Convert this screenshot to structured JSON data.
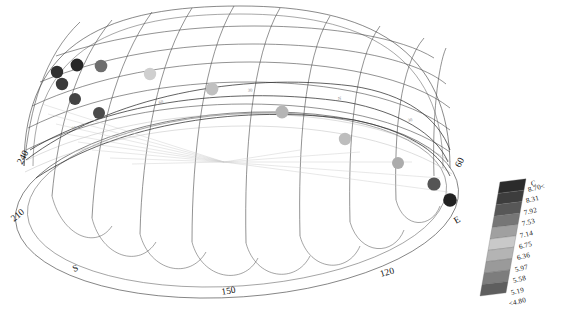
{
  "figure": {
    "kind": "sun-path-sky-dome",
    "caption": "",
    "background_color": "#ffffff",
    "line_color": "#3a3a3a",
    "faint_line_color": "#b9b9b9"
  },
  "azimuth_axis": {
    "name": "azimuth",
    "labels": [
      {
        "text": "240",
        "x": 22,
        "y": 165,
        "rotate": -62
      },
      {
        "text": "210",
        "x": 14,
        "y": 222,
        "rotate": -40
      },
      {
        "text": "S",
        "x": 74,
        "y": 272,
        "rotate": -22
      },
      {
        "text": "150",
        "x": 222,
        "y": 295,
        "rotate": -10
      },
      {
        "text": "120",
        "x": 381,
        "y": 277,
        "rotate": -16
      },
      {
        "text": "E",
        "x": 456,
        "y": 224,
        "rotate": -30
      },
      {
        "text": "60",
        "x": 460,
        "y": 168,
        "rotate": -62
      }
    ]
  },
  "elevation_axis": {
    "name": "elevation",
    "labels": [
      {
        "text": "30",
        "x": 72,
        "y": 130,
        "rotate": -14
      },
      {
        "text": "60",
        "x": 159,
        "y": 104,
        "rotate": -12
      },
      {
        "text": "30",
        "x": 248,
        "y": 92,
        "rotate": -7
      },
      {
        "text": "N",
        "x": 338,
        "y": 100,
        "rotate": -4
      },
      {
        "text": "30",
        "x": 408,
        "y": 122,
        "rotate": -10
      }
    ]
  },
  "colorbar": {
    "name": "temperature-colorbar",
    "unit_label": "C",
    "orientation": "vertical-tilted",
    "tilt_degrees": -13,
    "ticks": [
      {
        "text": "8.70<",
        "value": 8.7
      },
      {
        "text": "8.31",
        "value": 8.31
      },
      {
        "text": "7.92",
        "value": 7.92
      },
      {
        "text": "7.53",
        "value": 7.53
      },
      {
        "text": "7.14",
        "value": 7.14
      },
      {
        "text": "6.75",
        "value": 6.75
      },
      {
        "text": "6.36",
        "value": 6.36
      },
      {
        "text": "5.97",
        "value": 5.97
      },
      {
        "text": "5.58",
        "value": 5.58
      },
      {
        "text": "5.19",
        "value": 5.19
      },
      {
        "text": "<4.80",
        "value": 4.8
      }
    ],
    "swatch_colors": [
      "#2b2b2b",
      "#3d3d3d",
      "#575757",
      "#767676",
      "#a0a0a0",
      "#c9c9c9",
      "#b4b4b4",
      "#9a9a9a",
      "#7d7d7d",
      "#5e5e5e"
    ]
  },
  "chart_data": {
    "type": "scatter",
    "title": "",
    "xlabel": "azimuth",
    "ylabel": "elevation",
    "projection": "3d-hemisphere-wireframe",
    "colorscale_label": "C",
    "colorscale_min": 4.8,
    "colorscale_max": 8.7,
    "points": [
      {
        "x": 57,
        "y": 72,
        "r": 6.2,
        "value": 5.05,
        "color": "#303030"
      },
      {
        "x": 77,
        "y": 65,
        "r": 6.4,
        "value": 4.95,
        "color": "#262626"
      },
      {
        "x": 101,
        "y": 66,
        "r": 6.3,
        "value": 6.05,
        "color": "#6e6e6e"
      },
      {
        "x": 62,
        "y": 84,
        "r": 6.2,
        "value": 5.2,
        "color": "#3a3a3a"
      },
      {
        "x": 75,
        "y": 99,
        "r": 6.0,
        "value": 5.35,
        "color": "#434343"
      },
      {
        "x": 99,
        "y": 113,
        "r": 6.0,
        "value": 5.45,
        "color": "#4b4b4b"
      },
      {
        "x": 150,
        "y": 74,
        "r": 6.2,
        "value": 8.1,
        "color": "#cfcfcf"
      },
      {
        "x": 212,
        "y": 89,
        "r": 6.4,
        "value": 7.6,
        "color": "#c0c0c0"
      },
      {
        "x": 282,
        "y": 112,
        "r": 6.5,
        "value": 7.2,
        "color": "#b5b5b5"
      },
      {
        "x": 345,
        "y": 139,
        "r": 6.2,
        "value": 7.35,
        "color": "#bdbdbd"
      },
      {
        "x": 398,
        "y": 163,
        "r": 6.0,
        "value": 7.0,
        "color": "#acacac"
      },
      {
        "x": 434,
        "y": 184,
        "r": 6.6,
        "value": 5.7,
        "color": "#555555"
      },
      {
        "x": 450,
        "y": 200,
        "r": 6.8,
        "value": 4.9,
        "color": "#222222"
      }
    ]
  }
}
